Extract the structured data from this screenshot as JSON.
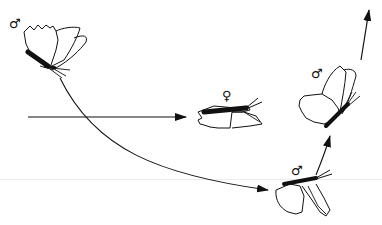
{
  "diagram": {
    "type": "butterfly-courtship-flight-sequence",
    "colors": {
      "ink": "#111111",
      "background": "#ffffff",
      "faint_rule": "#ececec"
    },
    "figures": [
      {
        "id": "male-start",
        "sex": "male",
        "symbol": "♂",
        "pose": "wings-raised, perched/start",
        "position": "top-left"
      },
      {
        "id": "female",
        "sex": "female",
        "symbol": "♀",
        "pose": "wings-lowered, side view",
        "position": "center"
      },
      {
        "id": "male-approach",
        "sex": "male",
        "symbol": "♂",
        "pose": "wings-lowered, side view",
        "position": "bottom-right"
      },
      {
        "id": "male-ascend",
        "sex": "male",
        "symbol": "♂",
        "pose": "wings-raised, ascending",
        "position": "top-right"
      }
    ],
    "arrows": [
      {
        "id": "straight-arrow",
        "from": "left-edge",
        "to": "female",
        "shape": "straight-horizontal"
      },
      {
        "id": "curved-arrow",
        "from": "male-start",
        "to": "male-approach",
        "shape": "curve-down-right"
      },
      {
        "id": "rise-arrow-1",
        "from": "male-approach",
        "to": "male-ascend",
        "shape": "curve-up"
      },
      {
        "id": "rise-arrow-2",
        "from": "male-ascend",
        "to": "top-edge",
        "shape": "straight-up"
      }
    ]
  }
}
